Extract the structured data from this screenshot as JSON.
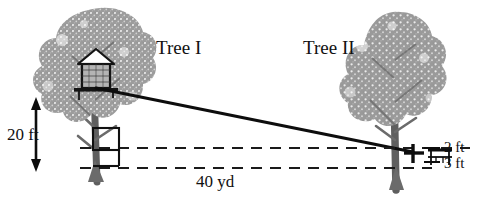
{
  "figure": {
    "background_color": "#ffffff",
    "ink_color": "#111111",
    "foliage_color": "#9a9a9a",
    "trunk_color": "#6e6e6e",
    "width": 491,
    "height": 198
  },
  "labels": {
    "tree_1": "Tree I",
    "tree_2": "Tree II",
    "height_left": "20 ft",
    "distance": "40 yd",
    "height_right_upper": "2 ft",
    "height_right_lower": "3 ft"
  },
  "elements": {
    "left_tree_name": "left-tree",
    "right_tree_name": "right-tree",
    "treehouse_name": "treehouse",
    "sight_line_name": "line-of-sight",
    "vertical_arrow_name": "height-dimension-arrow",
    "upper_dashed_name": "upper-dashed-baseline",
    "lower_dashed_name": "lower-dashed-baseline",
    "bench_name": "bench-marker",
    "trunk_square_name": "trunk-square-marker"
  },
  "measurements": {
    "treehouse_height_ft": 20,
    "separation_yd": 40,
    "upper_marker_ft": 2,
    "lower_marker_ft": 3
  }
}
